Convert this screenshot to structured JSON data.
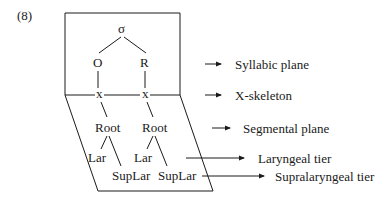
{
  "example_number": "(8)",
  "nodes": {
    "sigma": "σ",
    "onset": "O",
    "rhyme": "R",
    "x1": "x",
    "x2": "x",
    "root1": "Root",
    "root2": "Root",
    "lar1": "Lar",
    "lar2": "Lar",
    "suplar1": "SupLar",
    "suplar2": "SupLar"
  },
  "labels": {
    "syllabic_plane": "Syllabic plane",
    "x_skeleton": "X-skeleton",
    "segmental_plane": "Segmental plane",
    "laryngeal_tier": "Laryngeal tier",
    "supralaryngeal_tier": "Supralaryngeal tier"
  },
  "colors": {
    "line": "#1a1a1a",
    "background": "#ffffff"
  }
}
